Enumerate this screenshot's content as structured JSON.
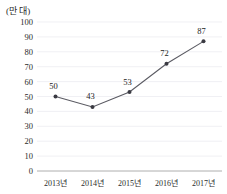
{
  "chart_data": {
    "type": "line",
    "title": "",
    "subtitle": "",
    "unit_label": "(만 대)",
    "xlabel": "",
    "ylabel": "",
    "categories": [
      "2013년",
      "2014년",
      "2015년",
      "2016년",
      "2017년"
    ],
    "values": [
      50,
      43,
      53,
      72,
      87
    ],
    "point_labels": [
      "50",
      "43",
      "53",
      "72",
      "87"
    ],
    "series": [
      {
        "name": "",
        "values": [
          50,
          43,
          53,
          72,
          87
        ]
      }
    ],
    "ylim": [
      0,
      100
    ],
    "ytick_step": 10,
    "yticks": [
      0,
      10,
      20,
      30,
      40,
      50,
      60,
      70,
      80,
      90,
      100
    ],
    "ytick_labels": [
      "0",
      "10",
      "20",
      "30",
      "40",
      "50",
      "60",
      "70",
      "80",
      "90",
      "100"
    ],
    "grid": true,
    "grid_axis": "y",
    "legend": false,
    "legend_position": "none",
    "marker": "circle",
    "colors": {
      "line": "#5a5a62",
      "marker": "#3a3a42",
      "grid": "#e9e9ef",
      "axis": "#9a9a9a",
      "text": "#2b2b2b",
      "background": "#ffffff"
    }
  }
}
